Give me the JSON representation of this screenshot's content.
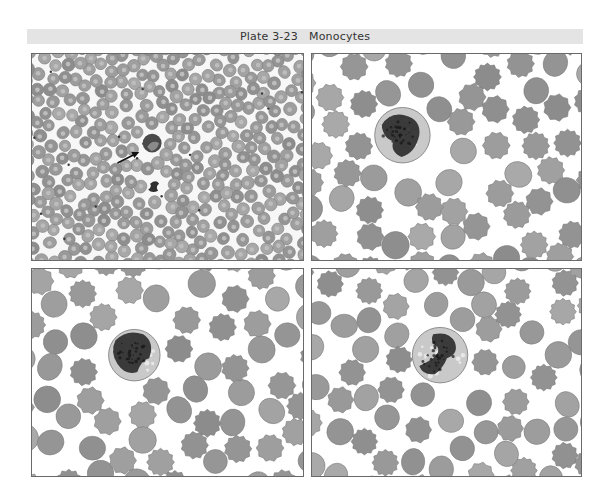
{
  "plate": {
    "title": "Plate 3-23   Monocytes",
    "header_color": "#e4e4e4",
    "panels": [
      {
        "position": "top-left",
        "content": "low-power blood smear with arrow indicating a monocyte",
        "arrow": true
      },
      {
        "position": "top-right",
        "content": "monocyte among crenated red blood cells"
      },
      {
        "position": "bottom-left",
        "content": "monocyte among crenated red blood cells"
      },
      {
        "position": "bottom-right",
        "content": "monocyte with folded nucleus among red blood cells"
      }
    ],
    "colors": {
      "rbc_fill": "#9a9a9a",
      "rbc_center": "#b8b8b8",
      "nucleus": "#2e2e2e",
      "cytoplasm": "#c9c9c9",
      "border": "#6a6a6a"
    }
  }
}
